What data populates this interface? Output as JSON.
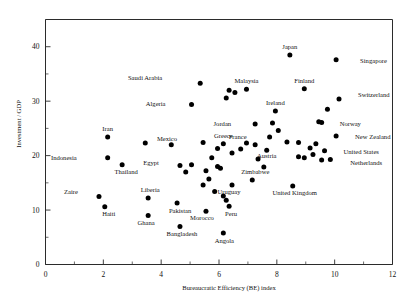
{
  "chart_data": {
    "type": "scatter",
    "title": "",
    "xlabel": "Bureaucratic Efficiency (BE) index",
    "ylabel": "Investment / GDP",
    "xlim": [
      0,
      12
    ],
    "ylim": [
      0,
      45
    ],
    "xticks": [
      0,
      2,
      4,
      6,
      8,
      10,
      12
    ],
    "xticks_minor": [
      1,
      3,
      5,
      7,
      9,
      11
    ],
    "yticks": [
      0,
      10,
      20,
      30,
      40
    ],
    "yticks_minor": [
      5,
      15,
      25,
      35,
      45
    ],
    "grid": false,
    "legend": "none",
    "marker_color": "#000000",
    "axis_color": "#2b2b2b",
    "points": [
      {
        "label": "Singapore",
        "x": 10.05,
        "y": 37.6,
        "lx": 24,
        "ly": 3
      },
      {
        "label": "Japan",
        "x": 8.45,
        "y": 38.5,
        "lx": 0,
        "ly": -6
      },
      {
        "label": "Saudi Arabia",
        "x": 5.35,
        "y": 33.3,
        "lx": -38,
        "ly": -3
      },
      {
        "label": "Malaysia",
        "x": 6.95,
        "y": 32.2,
        "lx": 0,
        "ly": -6
      },
      {
        "label": "Finland",
        "x": 8.95,
        "y": 32.3,
        "lx": 0,
        "ly": -6
      },
      {
        "label": "Algeria",
        "x": 5.05,
        "y": 29.4,
        "lx": -26,
        "ly": 2
      },
      {
        "label": "Switzerland",
        "x": 10.15,
        "y": 30.4,
        "lx": 19,
        "ly": -2
      },
      {
        "label": "Ireland",
        "x": 7.95,
        "y": 28.2,
        "lx": 0,
        "ly": -6
      },
      {
        "label": "Jordan",
        "x": 7.25,
        "y": 25.8,
        "lx": -24,
        "ly": 2
      },
      {
        "label": "Norway",
        "x": 9.55,
        "y": 26.1,
        "lx": 18,
        "ly": 4
      },
      {
        "label": "France",
        "x": 7.75,
        "y": 23.4,
        "lx": -23,
        "ly": 2
      },
      {
        "label": "New Zealand",
        "x": 10.05,
        "y": 23.6,
        "lx": 19,
        "ly": 3
      },
      {
        "label": "Greece",
        "x": 6.15,
        "y": 22.2,
        "lx": 0,
        "ly": -6
      },
      {
        "label": "Austria",
        "x": 7.65,
        "y": 21.0,
        "lx": 0,
        "ly": 8
      },
      {
        "label": "United States",
        "x": 9.65,
        "y": 20.9,
        "lx": 19,
        "ly": 3
      },
      {
        "label": "Netherlands",
        "x": 9.85,
        "y": 19.3,
        "lx": 20,
        "ly": 6
      },
      {
        "label": "Iran",
        "x": 2.15,
        "y": 23.4,
        "lx": 0,
        "ly": -6
      },
      {
        "label": "Mexico",
        "x": 5.45,
        "y": 22.4,
        "lx": -26,
        "ly": -2
      },
      {
        "label": "Indonesia",
        "x": 2.15,
        "y": 19.6,
        "lx": -31,
        "ly": 2
      },
      {
        "label": "Thailand",
        "x": 2.65,
        "y": 18.3,
        "lx": 4,
        "ly": 9
      },
      {
        "label": "Egypt",
        "x": 4.65,
        "y": 18.2,
        "lx": -21,
        "ly": 0
      },
      {
        "label": "Zimbabwe",
        "x": 7.15,
        "y": 15.5,
        "lx": 3,
        "ly": -6
      },
      {
        "label": "Uruguay",
        "x": 6.45,
        "y": 14.6,
        "lx": -3,
        "ly": 9
      },
      {
        "label": "United Kingdom",
        "x": 8.55,
        "y": 14.4,
        "lx": 2,
        "ly": 9
      },
      {
        "label": "Liberia",
        "x": 3.55,
        "y": 12.2,
        "lx": 2,
        "ly": -6
      },
      {
        "label": "Zaire",
        "x": 1.85,
        "y": 12.5,
        "lx": -21,
        "ly": -2
      },
      {
        "label": "Haiti",
        "x": 2.05,
        "y": 10.6,
        "lx": 4,
        "ly": 9
      },
      {
        "label": "Pakistan",
        "x": 4.55,
        "y": 11.3,
        "lx": 3,
        "ly": 10
      },
      {
        "label": "Ghana",
        "x": 3.55,
        "y": 9.0,
        "lx": -2,
        "ly": 9
      },
      {
        "label": "Bangladesh",
        "x": 4.65,
        "y": 7.0,
        "lx": 2,
        "ly": 10
      },
      {
        "label": "Morocco",
        "x": 5.55,
        "y": 9.8,
        "lx": -4,
        "ly": 9
      },
      {
        "label": "Peru",
        "x": 6.35,
        "y": 10.7,
        "lx": 2,
        "ly": 10
      },
      {
        "label": "Angola",
        "x": 6.15,
        "y": 5.8,
        "lx": 1,
        "ly": 10
      }
    ],
    "extra_points": [
      {
        "x": 6.35,
        "y": 32.0
      },
      {
        "x": 6.55,
        "y": 31.6
      },
      {
        "x": 6.25,
        "y": 30.6
      },
      {
        "x": 9.75,
        "y": 28.5
      },
      {
        "x": 9.45,
        "y": 26.2
      },
      {
        "x": 8.05,
        "y": 24.6
      },
      {
        "x": 7.85,
        "y": 26.0
      },
      {
        "x": 5.95,
        "y": 21.3
      },
      {
        "x": 6.45,
        "y": 20.5
      },
      {
        "x": 6.75,
        "y": 21.2
      },
      {
        "x": 5.75,
        "y": 19.6
      },
      {
        "x": 5.95,
        "y": 18.0
      },
      {
        "x": 6.05,
        "y": 17.7
      },
      {
        "x": 5.55,
        "y": 17.2
      },
      {
        "x": 4.85,
        "y": 17.0
      },
      {
        "x": 5.05,
        "y": 18.3
      },
      {
        "x": 5.65,
        "y": 15.7
      },
      {
        "x": 5.45,
        "y": 14.6
      },
      {
        "x": 5.85,
        "y": 13.4
      },
      {
        "x": 6.95,
        "y": 22.3
      },
      {
        "x": 7.25,
        "y": 22.0
      },
      {
        "x": 8.35,
        "y": 22.5
      },
      {
        "x": 8.75,
        "y": 22.4
      },
      {
        "x": 9.15,
        "y": 21.4
      },
      {
        "x": 9.35,
        "y": 22.2
      },
      {
        "x": 9.25,
        "y": 20.2
      },
      {
        "x": 8.95,
        "y": 19.6
      },
      {
        "x": 9.55,
        "y": 19.2
      },
      {
        "x": 8.75,
        "y": 19.8
      },
      {
        "x": 7.35,
        "y": 19.4
      },
      {
        "x": 7.55,
        "y": 17.9
      },
      {
        "x": 6.15,
        "y": 12.6
      },
      {
        "x": 6.25,
        "y": 11.8
      },
      {
        "x": 4.35,
        "y": 22.0
      },
      {
        "x": 3.45,
        "y": 22.3
      }
    ]
  },
  "axes": {
    "x_tick_labels": [
      "0",
      "2",
      "4",
      "6",
      "8",
      "10",
      "12"
    ],
    "y_tick_labels": [
      "0",
      "10",
      "20",
      "30",
      "40"
    ]
  }
}
